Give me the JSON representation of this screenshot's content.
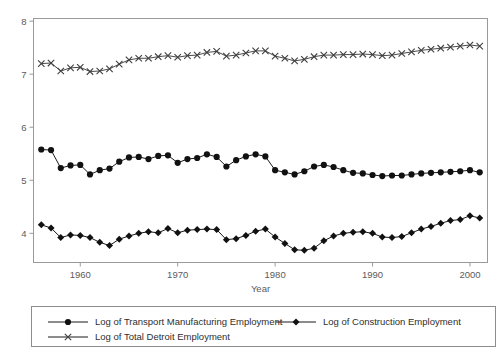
{
  "chart_data": {
    "type": "line",
    "title": "",
    "xlabel": "Year",
    "ylabel": "",
    "xlim": [
      1955.2,
      2001.8
    ],
    "ylim": [
      3.45,
      8.05
    ],
    "xticks": [
      1960,
      1970,
      1980,
      1990,
      2000
    ],
    "yticks": [
      4,
      5,
      6,
      7,
      8
    ],
    "xtick_labels": [
      "1960",
      "1970",
      "1980",
      "1990",
      "2000"
    ],
    "ytick_labels": [
      "4",
      "5",
      "6",
      "7",
      "8"
    ],
    "grid": false,
    "legend_position": "bottom",
    "x": [
      1956,
      1957,
      1958,
      1959,
      1960,
      1961,
      1962,
      1963,
      1964,
      1965,
      1966,
      1967,
      1968,
      1969,
      1970,
      1971,
      1972,
      1973,
      1974,
      1975,
      1976,
      1977,
      1978,
      1979,
      1980,
      1981,
      1982,
      1983,
      1984,
      1985,
      1986,
      1987,
      1988,
      1989,
      1990,
      1991,
      1992,
      1993,
      1994,
      1995,
      1996,
      1997,
      1998,
      1999,
      2000,
      2001
    ],
    "series": [
      {
        "name": "Log of Transport Manufacturing Employment",
        "marker": "circle",
        "values": [
          5.58,
          5.57,
          5.23,
          5.28,
          5.29,
          5.11,
          5.19,
          5.22,
          5.35,
          5.43,
          5.44,
          5.4,
          5.46,
          5.47,
          5.33,
          5.4,
          5.42,
          5.49,
          5.44,
          5.26,
          5.38,
          5.45,
          5.49,
          5.45,
          5.19,
          5.15,
          5.11,
          5.17,
          5.26,
          5.29,
          5.25,
          5.19,
          5.14,
          5.13,
          5.1,
          5.08,
          5.09,
          5.09,
          5.11,
          5.13,
          5.14,
          5.15,
          5.16,
          5.17,
          5.19,
          5.15
        ]
      },
      {
        "name": "Log of Construction Employment",
        "marker": "diamond",
        "values": [
          4.16,
          4.1,
          3.92,
          3.97,
          3.96,
          3.92,
          3.83,
          3.77,
          3.89,
          3.95,
          4.0,
          4.03,
          4.01,
          4.09,
          4.01,
          4.06,
          4.07,
          4.08,
          4.07,
          3.88,
          3.9,
          3.96,
          4.04,
          4.08,
          3.93,
          3.81,
          3.69,
          3.68,
          3.72,
          3.86,
          3.95,
          4.0,
          4.02,
          4.03,
          4.0,
          3.93,
          3.92,
          3.94,
          4.01,
          4.08,
          4.13,
          4.19,
          4.24,
          4.26,
          4.33,
          4.29
        ]
      },
      {
        "name": "Log of Total Detroit Employment",
        "marker": "x",
        "values": [
          7.2,
          7.21,
          7.06,
          7.12,
          7.13,
          7.05,
          7.06,
          7.1,
          7.19,
          7.27,
          7.3,
          7.3,
          7.33,
          7.35,
          7.32,
          7.35,
          7.36,
          7.41,
          7.43,
          7.34,
          7.36,
          7.4,
          7.44,
          7.44,
          7.34,
          7.3,
          7.25,
          7.28,
          7.33,
          7.36,
          7.36,
          7.37,
          7.37,
          7.38,
          7.37,
          7.35,
          7.36,
          7.39,
          7.42,
          7.45,
          7.47,
          7.49,
          7.51,
          7.53,
          7.55,
          7.53
        ]
      }
    ]
  },
  "legend": {
    "entries": [
      "Log of Transport Manufacturing Employment",
      "Log of Construction Employment",
      "Log of Total Detroit Employment"
    ]
  },
  "colors": {
    "line": "#1a1a1a",
    "axis": "#9a9a9a",
    "text": "#3a3a3a"
  }
}
